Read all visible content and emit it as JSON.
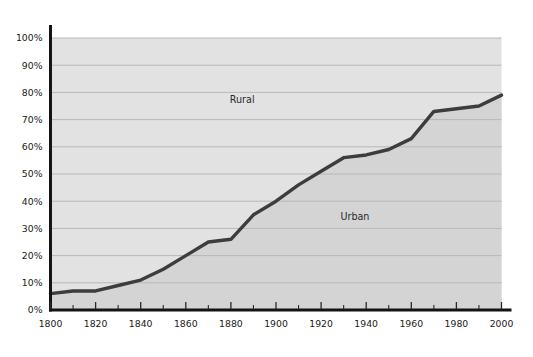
{
  "chart_data": {
    "type": "area",
    "title": "",
    "subtitle": "",
    "xlabel": "",
    "ylabel": "",
    "xlim": [
      1800,
      2000
    ],
    "ylim": [
      0,
      100
    ],
    "grid": true,
    "legend_position": "inline-annotations",
    "x": [
      1800,
      1810,
      1820,
      1830,
      1840,
      1850,
      1860,
      1870,
      1880,
      1890,
      1900,
      1910,
      1920,
      1930,
      1940,
      1950,
      1960,
      1970,
      1980,
      1990,
      2000
    ],
    "series": [
      {
        "name": "Urban",
        "values": [
          6,
          7,
          7,
          9,
          11,
          15,
          20,
          25,
          26,
          35,
          40,
          46,
          51,
          56,
          57,
          59,
          63,
          73,
          74,
          75,
          79
        ]
      },
      {
        "name": "Rural",
        "values": [
          94,
          93,
          93,
          91,
          89,
          85,
          80,
          75,
          74,
          65,
          60,
          54,
          49,
          44,
          43,
          41,
          37,
          27,
          26,
          25,
          21
        ]
      }
    ],
    "x_ticks_major": [
      1800,
      1820,
      1840,
      1860,
      1880,
      1900,
      1920,
      1940,
      1960,
      1980,
      2000
    ],
    "x_tick_labels": [
      "1800",
      "1820",
      "1840",
      "1860",
      "1880",
      "1900",
      "1920",
      "1940",
      "1960",
      "1980",
      "2000"
    ],
    "x_ticks_minor": [
      1810,
      1830,
      1850,
      1870,
      1890,
      1910,
      1930,
      1950,
      1970,
      1990
    ],
    "y_ticks": [
      0,
      10,
      20,
      30,
      40,
      50,
      60,
      70,
      80,
      90,
      100
    ],
    "y_tick_labels": [
      "0%",
      "10%",
      "20%",
      "30%",
      "40%",
      "50%",
      "60%",
      "70%",
      "80%",
      "90%",
      "100%"
    ],
    "annotations": [
      {
        "text": "Rural",
        "x": 1885,
        "y": 76
      },
      {
        "text": "Urban",
        "x": 1935,
        "y": 33
      }
    ],
    "colors": {
      "line": "#3d3d3d",
      "rural_fill": "#e2e2e2",
      "urban_fill": "#d4d4d4",
      "gridline": "#b8b8b8",
      "axis": "#141414",
      "tick_text": "#1a1a1a",
      "background": "#ffffff"
    }
  }
}
